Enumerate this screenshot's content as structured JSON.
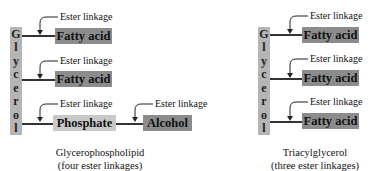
{
  "diagram": {
    "left": {
      "glycerol_letters": [
        "G",
        "l",
        "y",
        "c",
        "e",
        "r",
        "o",
        "l"
      ],
      "rows": [
        {
          "box": "Fatty acid",
          "linkage_label": "Ester linkage"
        },
        {
          "box": "Fatty acid",
          "linkage_label": "Ester linkage"
        },
        {
          "box": "Phosphate",
          "linkage_label": "Ester linkage"
        }
      ],
      "alcohol": {
        "box": "Alcohol",
        "linkage_label": "Ester linkage"
      },
      "caption_line1": "Glycerophospholipid",
      "caption_line2": "(four ester linkages)"
    },
    "right": {
      "glycerol_letters": [
        "G",
        "l",
        "y",
        "c",
        "e",
        "r",
        "o",
        "l"
      ],
      "rows": [
        {
          "box": "Fatty acid",
          "linkage_label": "Ester linkage"
        },
        {
          "box": "Fatty acid",
          "linkage_label": "Ester linkage"
        },
        {
          "box": "Fatty acid",
          "linkage_label": "Ester linkage"
        }
      ],
      "caption_line1": "Triacylglycerol",
      "caption_line2": "(three ester linkages)"
    },
    "colors": {
      "glycerol": "#b5b5b5",
      "fatty_acid": "#8c8c8c",
      "phosphate": "#c9c9c9",
      "alcohol": "#8c8c8c"
    }
  }
}
